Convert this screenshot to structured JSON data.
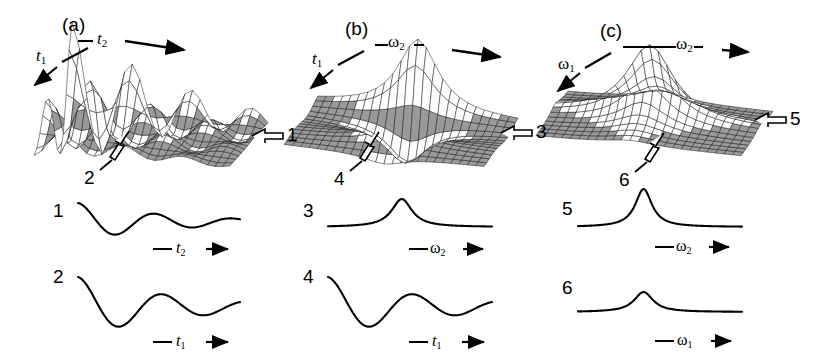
{
  "figure": {
    "type": "scientific-figure",
    "background_color": "#ffffff",
    "ink_color": "#000000",
    "mesh_color": "#1a1a1a",
    "shade_color": "#9a9a9a"
  },
  "panels": [
    {
      "id": "a",
      "label": "(a)",
      "domain": "time-time",
      "axes": [
        {
          "name": "t1",
          "text": "t",
          "sub": "1",
          "direction": "down-left"
        },
        {
          "name": "t2",
          "text": "t",
          "sub": "2",
          "direction": "right"
        }
      ],
      "callouts": [
        {
          "number": "1",
          "target": "right-edge",
          "arrow": "hollow-left"
        },
        {
          "number": "2",
          "target": "front-edge",
          "arrow": "hollow-up-right"
        }
      ],
      "surface": {
        "kind": "damped-oscillation-2d",
        "peaks": 5,
        "damping": "decays along both axes",
        "note": "oscillatory interferogram, ridges decaying toward large t"
      }
    },
    {
      "id": "b",
      "label": "(b)",
      "domain": "time-frequency",
      "axes": [
        {
          "name": "t1",
          "text": "t",
          "sub": "1",
          "direction": "down-left"
        },
        {
          "name": "omega2",
          "text": "ω",
          "sub": "2",
          "direction": "right"
        }
      ],
      "callouts": [
        {
          "number": "3",
          "target": "right-edge",
          "arrow": "hollow-left"
        },
        {
          "number": "4",
          "target": "front-edge",
          "arrow": "hollow-up-right"
        }
      ],
      "surface": {
        "kind": "lorentzian-ridge-oscillating",
        "peaks": 1,
        "damping": "single peak along omega2, oscillating along t1",
        "note": "partial Fourier transform of panel (a)"
      }
    },
    {
      "id": "c",
      "label": "(c)",
      "domain": "frequency-frequency",
      "axes": [
        {
          "name": "omega1",
          "text": "ω",
          "sub": "1",
          "direction": "down-left"
        },
        {
          "name": "omega2",
          "text": "ω",
          "sub": "2",
          "direction": "right"
        }
      ],
      "callouts": [
        {
          "number": "5",
          "target": "right-edge",
          "arrow": "hollow-left"
        },
        {
          "number": "6",
          "target": "front-edge",
          "arrow": "hollow-up-right"
        }
      ],
      "surface": {
        "kind": "lorentzian-2d",
        "peaks": 1,
        "damping": "single symmetric 2D Lorentzian peak",
        "note": "full 2D Fourier transform"
      }
    }
  ],
  "traces": [
    {
      "number": "1",
      "column": 0,
      "row": 0,
      "axis": {
        "text": "t",
        "sub": "2",
        "greek": false
      },
      "shape": "damped-oscillation",
      "amplitude": "medium",
      "description": "decaying cosine oscillation starting high, first minimum then ringing to baseline"
    },
    {
      "number": "2",
      "column": 0,
      "row": 1,
      "axis": {
        "text": "t",
        "sub": "1",
        "greek": false
      },
      "shape": "damped-oscillation",
      "amplitude": "large",
      "description": "deeper decaying oscillation with larger first dip"
    },
    {
      "number": "3",
      "column": 1,
      "row": 0,
      "axis": {
        "text": "ω",
        "sub": "2",
        "greek": true
      },
      "shape": "lorentzian-peak",
      "amplitude": "medium",
      "description": "single absorptive Lorentzian line on flat baseline"
    },
    {
      "number": "4",
      "column": 1,
      "row": 1,
      "axis": {
        "text": "t",
        "sub": "1",
        "greek": false
      },
      "shape": "damped-oscillation",
      "amplitude": "large",
      "description": "deep decaying oscillation identical in character to trace 2"
    },
    {
      "number": "5",
      "column": 2,
      "row": 0,
      "axis": {
        "text": "ω",
        "sub": "2",
        "greek": true
      },
      "shape": "lorentzian-peak",
      "amplitude": "large",
      "description": "tall narrow Lorentzian line"
    },
    {
      "number": "6",
      "column": 2,
      "row": 1,
      "axis": {
        "text": "ω",
        "sub": "1",
        "greek": true
      },
      "shape": "lorentzian-peak",
      "amplitude": "small",
      "description": "short broad Lorentzian line"
    }
  ]
}
